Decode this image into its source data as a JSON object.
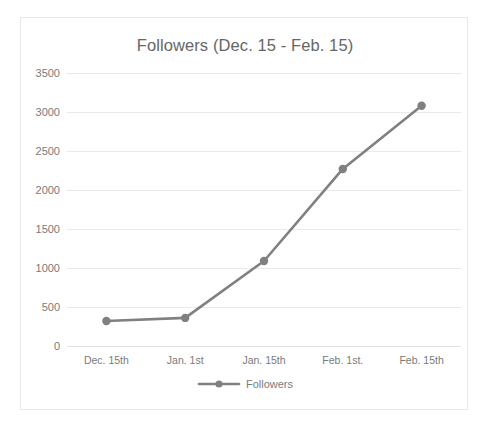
{
  "chart_data": {
    "type": "line",
    "title": "Followers (Dec. 15 - Feb. 15)",
    "xlabel": "",
    "ylabel": "",
    "categories": [
      "Dec. 15th",
      "Jan. 1st",
      "Jan. 15th",
      "Feb. 1st.",
      "Feb. 15th"
    ],
    "series": [
      {
        "name": "Followers",
        "values": [
          320,
          360,
          1090,
          2270,
          3080
        ]
      }
    ],
    "ylim": [
      0,
      3500
    ],
    "yticks": [
      0,
      500,
      1000,
      1500,
      2000,
      2500,
      3000,
      3500
    ],
    "ytick_labels": [
      "0",
      "500",
      "1000",
      "1500",
      "2000",
      "2500",
      "3000",
      "3500"
    ],
    "grid": true,
    "legend": {
      "position": "bottom",
      "entries": [
        "Followers"
      ],
      "marker": "circle-marker"
    },
    "colors": {
      "series_line": "#808080",
      "marker": "#808080",
      "gridline": "#eaeaea",
      "text": "#7a7a7a",
      "title_text": "#666666",
      "border": "#e6e6e6",
      "background": "#ffffff"
    }
  }
}
